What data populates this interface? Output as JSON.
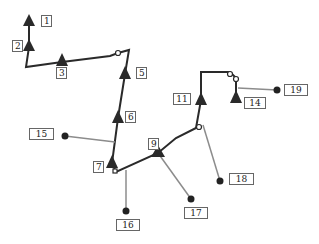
{
  "diagram": {
    "colors": {
      "main_line": "#2a2a2a",
      "branch_line": "#8c8c8c",
      "node": "#2a2a2a",
      "label_border": "#666666"
    },
    "triangles": [
      {
        "id": "1",
        "x": 29,
        "y": 22
      },
      {
        "id": "2",
        "x": 29,
        "y": 47
      },
      {
        "id": "3",
        "x": 62,
        "y": 61
      },
      {
        "id": "5",
        "x": 125,
        "y": 74
      },
      {
        "id": "6",
        "x": 118,
        "y": 118
      },
      {
        "id": "7",
        "x": 112,
        "y": 163
      },
      {
        "id": "9",
        "x": 158,
        "y": 153
      },
      {
        "id": "11",
        "x": 201,
        "y": 100
      },
      {
        "id": "14",
        "x": 236,
        "y": 98
      }
    ],
    "dots": [
      {
        "id": "15",
        "x": 65,
        "y": 136
      },
      {
        "id": "16",
        "x": 126,
        "y": 211
      },
      {
        "id": "17",
        "x": 191,
        "y": 199
      },
      {
        "id": "18",
        "x": 220,
        "y": 181
      },
      {
        "id": "19",
        "x": 277,
        "y": 90
      }
    ],
    "labels": [
      {
        "id": "1",
        "text": "1",
        "x": 41,
        "y": 15,
        "w": 11
      },
      {
        "id": "2",
        "text": "2",
        "x": 12,
        "y": 40,
        "w": 11
      },
      {
        "id": "3",
        "text": "3",
        "x": 56,
        "y": 67,
        "w": 11
      },
      {
        "id": "5",
        "text": "5",
        "x": 136,
        "y": 67,
        "w": 11
      },
      {
        "id": "6",
        "text": "6",
        "x": 125,
        "y": 111,
        "w": 11
      },
      {
        "id": "7",
        "text": "7",
        "x": 93,
        "y": 161,
        "w": 11
      },
      {
        "id": "9",
        "text": "9",
        "x": 148,
        "y": 138,
        "w": 11
      },
      {
        "id": "11",
        "text": "11",
        "x": 173,
        "y": 93,
        "w": 18
      },
      {
        "id": "14",
        "text": "14",
        "x": 244,
        "y": 97,
        "w": 22
      },
      {
        "id": "15",
        "text": "15",
        "x": 29,
        "y": 128,
        "w": 25
      },
      {
        "id": "16",
        "text": "16",
        "x": 116,
        "y": 219,
        "w": 24
      },
      {
        "id": "17",
        "text": "17",
        "x": 184,
        "y": 207,
        "w": 24
      },
      {
        "id": "18",
        "text": "18",
        "x": 229,
        "y": 173,
        "w": 25
      },
      {
        "id": "19",
        "text": "19",
        "x": 284,
        "y": 84,
        "w": 24
      }
    ]
  }
}
